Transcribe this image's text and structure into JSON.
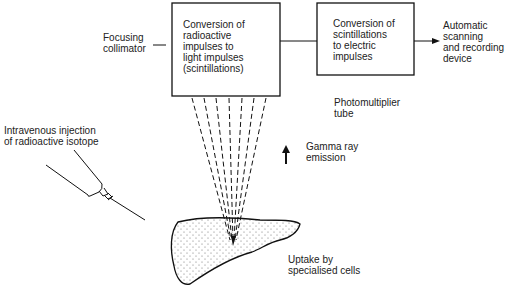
{
  "diagram": {
    "boxes": [
      {
        "id": "scintillator",
        "text": "Conversion of\nradioactive\nimpulses to\nlight impulses\n(scintillations)"
      },
      {
        "id": "photomultiplier",
        "text": "Conversion of\nscintillations\nto electric\nimpulses"
      }
    ],
    "labels": {
      "collimator": "Focusing\ncollimator",
      "output": "Automatic\nscanning\nand recording\ndevice",
      "photomultiplier": "Photomultiplier\ntube",
      "injection": "Intravenous injection\nof radioactive isotope",
      "gamma": "Gamma ray\nemission",
      "uptake": "Uptake by\nspecialised cells"
    },
    "colors": {
      "line": "#111111",
      "stipple": "#555555"
    }
  }
}
